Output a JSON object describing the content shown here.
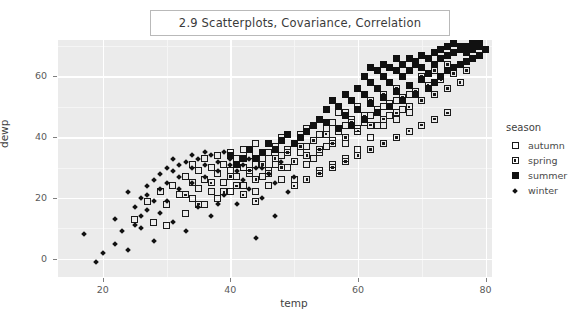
{
  "title": {
    "text": "2.9  Scatterplots, Covariance, Correlation"
  },
  "axes": {
    "xlabel": "temp",
    "ylabel": "dewp",
    "x_ticks": [
      "20",
      "40",
      "60",
      "80"
    ],
    "y_ticks": [
      "0",
      "20",
      "40",
      "60"
    ]
  },
  "legend": {
    "title": "season",
    "items": [
      {
        "label": "autumn",
        "marker": "open-square-icon"
      },
      {
        "label": "spring",
        "marker": "dotted-square-icon"
      },
      {
        "label": "summer",
        "marker": "filled-square-icon"
      },
      {
        "label": "winter",
        "marker": "small-diamond-icon"
      }
    ]
  },
  "chart_data": {
    "type": "scatter",
    "title": "2.9  Scatterplots, Covariance, Correlation",
    "xlabel": "temp",
    "ylabel": "dewp",
    "xlim": [
      13,
      81
    ],
    "ylim": [
      -6,
      72
    ],
    "x_ticks": [
      20,
      40,
      60,
      80
    ],
    "y_ticks": [
      0,
      20,
      40,
      60
    ],
    "grid": true,
    "legend_title": "season",
    "legend_position": "right",
    "series": [
      {
        "name": "autumn",
        "marker": "open-square",
        "points": [
          [
            25,
            13
          ],
          [
            27,
            19
          ],
          [
            28,
            12
          ],
          [
            29,
            22
          ],
          [
            30,
            18
          ],
          [
            31,
            24
          ],
          [
            32,
            21
          ],
          [
            33,
            27
          ],
          [
            33,
            15
          ],
          [
            34,
            25
          ],
          [
            34,
            31
          ],
          [
            35,
            23
          ],
          [
            35,
            29
          ],
          [
            36,
            26
          ],
          [
            36,
            33
          ],
          [
            37,
            30
          ],
          [
            37,
            22
          ],
          [
            38,
            28
          ],
          [
            38,
            34
          ],
          [
            39,
            25
          ],
          [
            39,
            31
          ],
          [
            40,
            29
          ],
          [
            40,
            35
          ],
          [
            41,
            27
          ],
          [
            41,
            33
          ],
          [
            42,
            30
          ],
          [
            42,
            36
          ],
          [
            43,
            28
          ],
          [
            43,
            34
          ],
          [
            44,
            31
          ],
          [
            44,
            38
          ],
          [
            45,
            33
          ],
          [
            45,
            27
          ],
          [
            46,
            35
          ],
          [
            46,
            29
          ],
          [
            47,
            37
          ],
          [
            47,
            31
          ],
          [
            48,
            34
          ],
          [
            48,
            40
          ],
          [
            49,
            36
          ],
          [
            49,
            30
          ],
          [
            50,
            38
          ],
          [
            50,
            32
          ],
          [
            51,
            35
          ],
          [
            51,
            41
          ],
          [
            52,
            37
          ],
          [
            52,
            43
          ],
          [
            53,
            39
          ],
          [
            53,
            33
          ],
          [
            54,
            41
          ],
          [
            54,
            35
          ],
          [
            55,
            43
          ],
          [
            55,
            37
          ],
          [
            56,
            45
          ],
          [
            56,
            39
          ],
          [
            57,
            42
          ],
          [
            57,
            48
          ],
          [
            58,
            44
          ],
          [
            58,
            38
          ],
          [
            59,
            46
          ],
          [
            60,
            43
          ],
          [
            60,
            49
          ],
          [
            61,
            45
          ],
          [
            62,
            47
          ],
          [
            63,
            44
          ],
          [
            64,
            50
          ],
          [
            65,
            47
          ],
          [
            66,
            52
          ],
          [
            67,
            49
          ],
          [
            68,
            54
          ],
          [
            34,
            20
          ],
          [
            36,
            18
          ],
          [
            30,
            11
          ],
          [
            42,
            24
          ],
          [
            46,
            24
          ],
          [
            50,
            26
          ],
          [
            44,
            22
          ],
          [
            52,
            31
          ],
          [
            54,
            29
          ],
          [
            58,
            33
          ],
          [
            56,
            31
          ],
          [
            60,
            36
          ],
          [
            62,
            40
          ],
          [
            64,
            44
          ],
          [
            66,
            46
          ],
          [
            68,
            48
          ],
          [
            70,
            52
          ],
          [
            48,
            26
          ],
          [
            38,
            20
          ],
          [
            40,
            22
          ]
        ]
      },
      {
        "name": "spring",
        "marker": "dotted-square",
        "points": [
          [
            33,
            21
          ],
          [
            35,
            18
          ],
          [
            37,
            25
          ],
          [
            39,
            22
          ],
          [
            40,
            27
          ],
          [
            41,
            24
          ],
          [
            43,
            29
          ],
          [
            44,
            26
          ],
          [
            45,
            31
          ],
          [
            46,
            28
          ],
          [
            47,
            33
          ],
          [
            48,
            30
          ],
          [
            49,
            35
          ],
          [
            50,
            32
          ],
          [
            51,
            37
          ],
          [
            52,
            34
          ],
          [
            53,
            39
          ],
          [
            54,
            36
          ],
          [
            55,
            41
          ],
          [
            56,
            38
          ],
          [
            57,
            43
          ],
          [
            58,
            40
          ],
          [
            59,
            45
          ],
          [
            60,
            42
          ],
          [
            61,
            47
          ],
          [
            62,
            44
          ],
          [
            63,
            49
          ],
          [
            64,
            46
          ],
          [
            65,
            51
          ],
          [
            66,
            48
          ],
          [
            67,
            53
          ],
          [
            68,
            50
          ],
          [
            69,
            55
          ],
          [
            70,
            52
          ],
          [
            71,
            57
          ],
          [
            72,
            54
          ],
          [
            73,
            59
          ],
          [
            74,
            56
          ],
          [
            75,
            61
          ],
          [
            76,
            58
          ],
          [
            60,
            34
          ],
          [
            62,
            36
          ],
          [
            64,
            38
          ],
          [
            66,
            40
          ],
          [
            58,
            32
          ],
          [
            56,
            30
          ],
          [
            54,
            28
          ],
          [
            70,
            44
          ],
          [
            72,
            46
          ],
          [
            74,
            48
          ],
          [
            68,
            42
          ],
          [
            76,
            64
          ],
          [
            77,
            62
          ],
          [
            78,
            66
          ],
          [
            52,
            26
          ],
          [
            50,
            24
          ],
          [
            66,
            56
          ],
          [
            64,
            54
          ],
          [
            62,
            52
          ],
          [
            60,
            50
          ],
          [
            58,
            48
          ],
          [
            42,
            21
          ],
          [
            44,
            19
          ],
          [
            72,
            62
          ],
          [
            74,
            64
          ],
          [
            70,
            60
          ]
        ]
      },
      {
        "name": "summer",
        "marker": "filled-square",
        "points": [
          [
            55,
            45
          ],
          [
            57,
            43
          ],
          [
            58,
            47
          ],
          [
            59,
            44
          ],
          [
            60,
            49
          ],
          [
            61,
            46
          ],
          [
            62,
            51
          ],
          [
            63,
            48
          ],
          [
            64,
            53
          ],
          [
            65,
            50
          ],
          [
            66,
            55
          ],
          [
            67,
            52
          ],
          [
            68,
            57
          ],
          [
            69,
            54
          ],
          [
            70,
            59
          ],
          [
            70,
            63
          ],
          [
            71,
            56
          ],
          [
            71,
            61
          ],
          [
            72,
            58
          ],
          [
            72,
            64
          ],
          [
            73,
            60
          ],
          [
            73,
            66
          ],
          [
            74,
            62
          ],
          [
            74,
            67
          ],
          [
            75,
            63
          ],
          [
            75,
            68
          ],
          [
            76,
            64
          ],
          [
            76,
            69
          ],
          [
            77,
            65
          ],
          [
            77,
            70
          ],
          [
            78,
            66
          ],
          [
            78,
            71
          ],
          [
            79,
            67
          ],
          [
            79,
            70
          ],
          [
            80,
            69
          ],
          [
            68,
            62
          ],
          [
            69,
            64
          ],
          [
            67,
            60
          ],
          [
            66,
            62
          ],
          [
            65,
            58
          ],
          [
            64,
            60
          ],
          [
            63,
            56
          ],
          [
            62,
            58
          ],
          [
            61,
            54
          ],
          [
            60,
            56
          ],
          [
            59,
            52
          ],
          [
            58,
            54
          ],
          [
            57,
            50
          ],
          [
            56,
            52
          ],
          [
            55,
            49
          ],
          [
            54,
            46
          ],
          [
            53,
            44
          ],
          [
            52,
            42
          ],
          [
            51,
            40
          ],
          [
            50,
            38
          ],
          [
            49,
            41
          ],
          [
            48,
            39
          ],
          [
            47,
            36
          ],
          [
            46,
            38
          ],
          [
            45,
            35
          ],
          [
            44,
            33
          ],
          [
            43,
            36
          ],
          [
            42,
            33
          ],
          [
            41,
            31
          ],
          [
            40,
            34
          ],
          [
            72,
            68
          ],
          [
            73,
            69
          ],
          [
            71,
            66
          ],
          [
            70,
            67
          ],
          [
            69,
            65
          ],
          [
            68,
            66
          ],
          [
            67,
            64
          ],
          [
            66,
            66
          ],
          [
            65,
            63
          ],
          [
            74,
            70
          ],
          [
            75,
            71
          ],
          [
            76,
            70
          ],
          [
            77,
            68
          ],
          [
            78,
            69
          ],
          [
            79,
            71
          ],
          [
            64,
            64
          ],
          [
            63,
            62
          ],
          [
            62,
            63
          ],
          [
            61,
            60
          ]
        ]
      },
      {
        "name": "winter",
        "marker": "small-diamond",
        "points": [
          [
            17,
            8
          ],
          [
            19,
            -1
          ],
          [
            22,
            13
          ],
          [
            24,
            3
          ],
          [
            25,
            17
          ],
          [
            26,
            10
          ],
          [
            27,
            21
          ],
          [
            28,
            6
          ],
          [
            29,
            15
          ],
          [
            30,
            19
          ],
          [
            31,
            12
          ],
          [
            32,
            23
          ],
          [
            33,
            9
          ],
          [
            34,
            25
          ],
          [
            35,
            17
          ],
          [
            36,
            27
          ],
          [
            37,
            14
          ],
          [
            38,
            29
          ],
          [
            39,
            21
          ],
          [
            40,
            31
          ],
          [
            41,
            18
          ],
          [
            42,
            26
          ],
          [
            43,
            23
          ],
          [
            44,
            30
          ],
          [
            45,
            20
          ],
          [
            46,
            28
          ],
          [
            47,
            25
          ],
          [
            48,
            32
          ],
          [
            49,
            22
          ],
          [
            50,
            27
          ],
          [
            33,
            32
          ],
          [
            34,
            30
          ],
          [
            35,
            33
          ],
          [
            36,
            31
          ],
          [
            37,
            34
          ],
          [
            38,
            32
          ],
          [
            39,
            35
          ],
          [
            40,
            33
          ],
          [
            31,
            29
          ],
          [
            32,
            27
          ],
          [
            30,
            25
          ],
          [
            29,
            23
          ],
          [
            28,
            19
          ],
          [
            27,
            16
          ],
          [
            26,
            14
          ],
          [
            25,
            11
          ],
          [
            24,
            22
          ],
          [
            23,
            9
          ],
          [
            44,
            7
          ],
          [
            47,
            14
          ],
          [
            41,
            29
          ],
          [
            42,
            31
          ],
          [
            43,
            33
          ],
          [
            45,
            30
          ],
          [
            36,
            35
          ],
          [
            34,
            34
          ],
          [
            32,
            31
          ],
          [
            31,
            33
          ],
          [
            30,
            30
          ],
          [
            29,
            28
          ],
          [
            28,
            26
          ],
          [
            27,
            24
          ],
          [
            26,
            20
          ],
          [
            22,
            5
          ],
          [
            20,
            2
          ],
          [
            38,
            18
          ]
        ]
      }
    ]
  }
}
